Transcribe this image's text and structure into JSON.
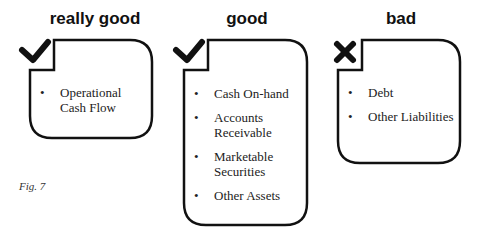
{
  "columns": [
    {
      "title": "really good",
      "marker": "check-icon",
      "items": [
        "Operational Cash Flow"
      ]
    },
    {
      "title": "good",
      "marker": "check-icon",
      "items": [
        "Cash On-hand",
        "Accounts Receivable",
        "Marketable Securities",
        "Other Assets"
      ]
    },
    {
      "title": "bad",
      "marker": "x-icon",
      "items": [
        "Debt",
        "Other Liabilities"
      ]
    }
  ],
  "caption": "Fig. 7",
  "colors": {
    "stroke": "#111111",
    "text": "#222222",
    "background": "#ffffff"
  }
}
